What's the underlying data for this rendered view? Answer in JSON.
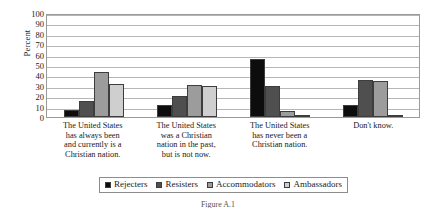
{
  "chart_data": {
    "type": "bar",
    "title": "",
    "xlabel": "",
    "ylabel": "Percent",
    "ylim": [
      0,
      100
    ],
    "ytick_step": 10,
    "yticks": [
      100,
      90,
      80,
      70,
      60,
      50,
      40,
      30,
      20,
      10,
      0
    ],
    "grid": true,
    "legend_position": "bottom",
    "categories": [
      "The United States has always been and currently is a Christian nation.",
      "The United States was a Christian nation in the past, but is not now.",
      "The United States has never been a Christian nation.",
      "Don't know."
    ],
    "category_lines": [
      [
        "The United States",
        "has always been",
        "and currently is a",
        "Christian nation."
      ],
      [
        "The United States",
        "was a Christian",
        "nation in the past,",
        "but is not now."
      ],
      [
        "The United States",
        "has never been a",
        "Christian nation."
      ],
      [
        "Don't know."
      ]
    ],
    "series": [
      {
        "name": "Rejecters",
        "color": "#0d0d0d",
        "values": [
          7,
          12,
          56,
          12
        ]
      },
      {
        "name": "Resisters",
        "color": "#4f4f4f",
        "values": [
          15,
          20,
          30,
          36
        ]
      },
      {
        "name": "Accommodators",
        "color": "#9c9c9c",
        "values": [
          43,
          31,
          6,
          35
        ]
      },
      {
        "name": "Ambassadors",
        "color": "#cfcfcf",
        "values": [
          32,
          30,
          2,
          2
        ]
      }
    ]
  },
  "figure": {
    "caption": "Figure A.1"
  }
}
